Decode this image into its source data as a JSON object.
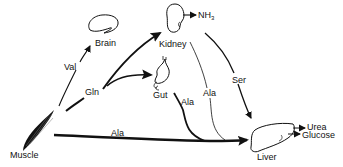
{
  "diagram": {
    "organs": {
      "muscle": {
        "label": "Muscle"
      },
      "brain": {
        "label": "Brain"
      },
      "kidney": {
        "label": "Kidney"
      },
      "gut": {
        "label": "Gut"
      },
      "liver": {
        "label": "Liver"
      }
    },
    "products": {
      "kidney_product": {
        "label": "NH",
        "subscript": "3"
      },
      "liver_product_1": {
        "label": "Urea"
      },
      "liver_product_2": {
        "label": "Glucose"
      }
    },
    "flows": [
      {
        "from": "Muscle",
        "to": "Brain",
        "label": "Val"
      },
      {
        "from": "Muscle",
        "to": "Kidney",
        "label": "Gln"
      },
      {
        "from": "Muscle",
        "to": "Gut",
        "label": "Gln"
      },
      {
        "from": "Muscle",
        "to": "Liver",
        "label": "Ala"
      },
      {
        "from": "Gut",
        "to": "Liver",
        "label": "Ala"
      },
      {
        "from": "Kidney",
        "to": "Liver",
        "label": "Ala"
      },
      {
        "from": "Kidney",
        "to": "Liver",
        "label": "Ser"
      },
      {
        "from": "Kidney",
        "to": "NH3",
        "label": ""
      },
      {
        "from": "Liver",
        "to": "Urea",
        "label": ""
      },
      {
        "from": "Liver",
        "to": "Glucose",
        "label": ""
      }
    ],
    "flow_labels": {
      "val": "Val",
      "gln": "Gln",
      "ala_muscle": "Ala",
      "ala_gut": "Ala",
      "ala_kidney": "Ala",
      "ser": "Ser"
    },
    "colors": {
      "ink": "#111111",
      "background": "#ffffff"
    }
  }
}
